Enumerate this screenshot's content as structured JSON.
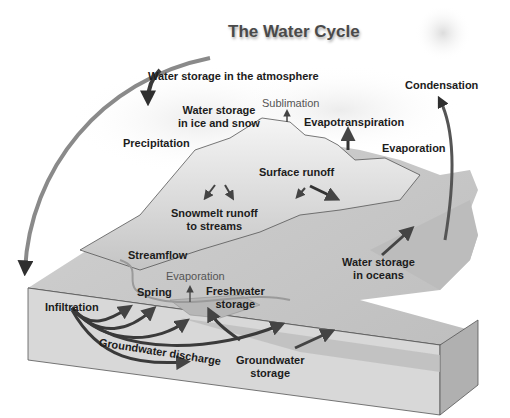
{
  "title": "The Water Cycle",
  "palette": {
    "background": "#ffffff",
    "land_top": "#c9c9c9",
    "land_side": "#b7b7b7",
    "soil_front": "#d4d4d4",
    "mountain_snow": "#eeeeee",
    "arrows": "#3a3a3a",
    "text": "#1c1c1c",
    "light_text": "#555555"
  },
  "labels": {
    "atmosphere": "Water storage in the atmosphere",
    "condensation": "Condensation",
    "ice_snow_line1": "Water storage",
    "ice_snow_line2": "in ice and snow",
    "sublimation": "Sublimation",
    "evapotranspiration": "Evapotranspiration",
    "precipitation": "Precipitation",
    "evaporation_sea": "Evaporation",
    "surface_runoff": "Surface runoff",
    "snowmelt_line1": "Snowmelt runoff",
    "snowmelt_line2": "to streams",
    "streamflow": "Streamflow",
    "evaporation_lake": "Evaporation",
    "spring": "Spring",
    "freshwater_line1": "Freshwater",
    "freshwater_line2": "storage",
    "infiltration": "Infiltration",
    "groundwater_discharge": "Groundwater discharge",
    "groundwater_storage_line1": "Groundwater",
    "groundwater_storage_line2": "storage",
    "oceans_line1": "Water storage",
    "oceans_line2": "in oceans"
  }
}
